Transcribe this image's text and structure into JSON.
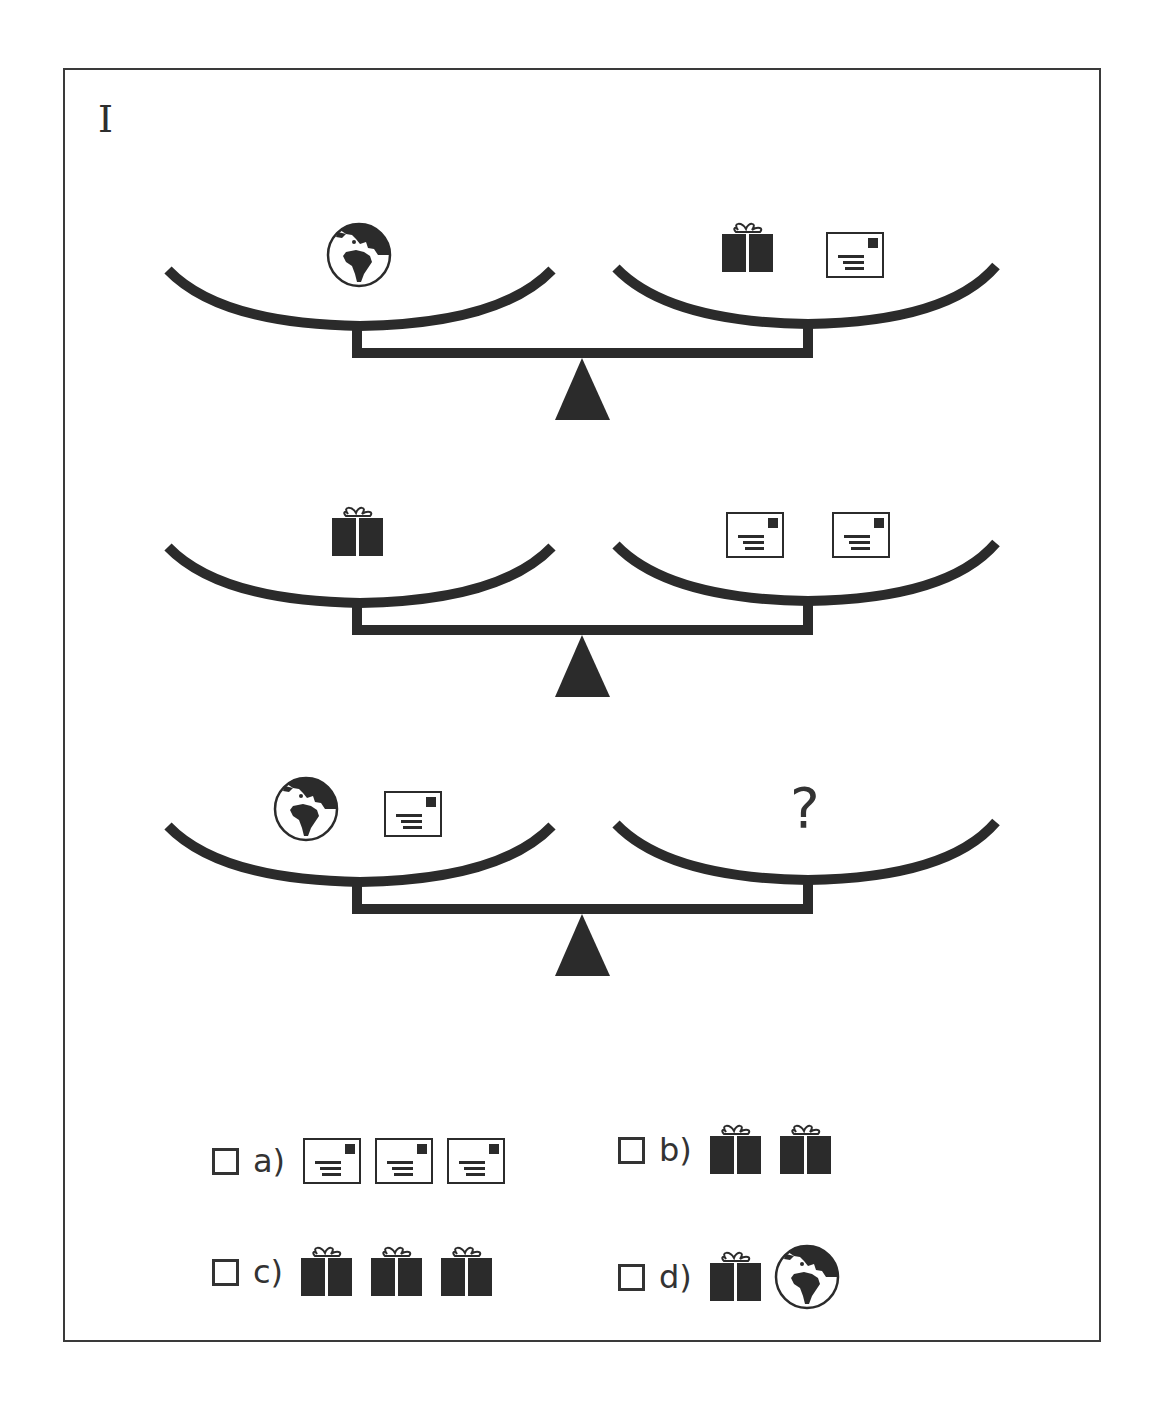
{
  "puzzle": {
    "label": "I",
    "colors": {
      "ink": "#2b2b2b",
      "frame": "#3a3a3a",
      "background": "#ffffff"
    },
    "scales": [
      {
        "left": [
          "globe-icon"
        ],
        "right": [
          "gift-icon",
          "envelope-icon"
        ],
        "state": "balanced"
      },
      {
        "left": [
          "gift-icon"
        ],
        "right": [
          "envelope-icon",
          "envelope-icon"
        ],
        "state": "balanced"
      },
      {
        "left": [
          "globe-icon",
          "envelope-icon"
        ],
        "right": [
          "?"
        ],
        "state": "balanced"
      }
    ],
    "question_mark": "?",
    "options": [
      {
        "label": "a)",
        "items": [
          "envelope-icon",
          "envelope-icon",
          "envelope-icon"
        ]
      },
      {
        "label": "b)",
        "items": [
          "gift-icon",
          "gift-icon"
        ]
      },
      {
        "label": "c)",
        "items": [
          "gift-icon",
          "gift-icon",
          "gift-icon"
        ]
      },
      {
        "label": "d)",
        "items": [
          "gift-icon",
          "globe-icon"
        ]
      }
    ]
  }
}
